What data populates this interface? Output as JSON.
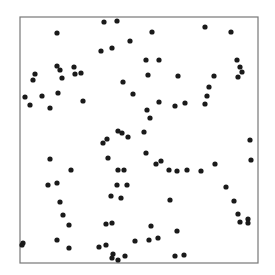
{
  "chart_data": {
    "type": "scatter",
    "title": "",
    "xlabel": "",
    "ylabel": "",
    "xlim": [
      0,
      1
    ],
    "ylim": [
      0,
      1
    ],
    "grid": false,
    "legend": null,
    "axes_ticks": false,
    "frame": {
      "left": 20,
      "top": 17,
      "right": 258,
      "bottom": 263,
      "color": "#777777"
    },
    "marker": {
      "color": "#1a1a1a",
      "radius": 2.6
    },
    "points_px": [
      [
        104,
        22
      ],
      [
        117,
        21
      ],
      [
        57,
        33
      ],
      [
        152,
        32
      ],
      [
        205,
        27
      ],
      [
        231,
        32
      ],
      [
        130,
        41
      ],
      [
        112,
        48
      ],
      [
        101,
        51
      ],
      [
        237,
        60
      ],
      [
        240,
        67
      ],
      [
        242,
        72
      ],
      [
        238,
        77
      ],
      [
        146,
        60
      ],
      [
        159,
        60
      ],
      [
        214,
        76
      ],
      [
        178,
        76
      ],
      [
        74,
        67
      ],
      [
        57,
        66
      ],
      [
        60,
        70
      ],
      [
        62,
        78
      ],
      [
        35,
        74
      ],
      [
        33,
        80
      ],
      [
        75,
        74
      ],
      [
        81,
        73
      ],
      [
        58,
        93
      ],
      [
        25,
        97
      ],
      [
        42,
        96
      ],
      [
        83,
        101
      ],
      [
        30,
        105
      ],
      [
        50,
        108
      ],
      [
        133,
        94
      ],
      [
        123,
        82
      ],
      [
        148,
        75
      ],
      [
        147,
        110
      ],
      [
        150,
        118
      ],
      [
        144,
        132
      ],
      [
        118,
        131
      ],
      [
        128,
        137
      ],
      [
        122,
        133
      ],
      [
        107,
        139
      ],
      [
        103,
        143
      ],
      [
        209,
        87
      ],
      [
        207,
        96
      ],
      [
        185,
        103
      ],
      [
        205,
        104
      ],
      [
        175,
        106
      ],
      [
        159,
        102
      ],
      [
        146,
        153
      ],
      [
        161,
        161
      ],
      [
        169,
        170
      ],
      [
        156,
        164
      ],
      [
        187,
        170
      ],
      [
        177,
        171
      ],
      [
        201,
        171
      ],
      [
        215,
        164
      ],
      [
        250,
        140
      ],
      [
        251,
        160
      ],
      [
        226,
        187
      ],
      [
        234,
        201
      ],
      [
        238,
        214
      ],
      [
        248,
        219
      ],
      [
        240,
        222
      ],
      [
        248,
        223
      ],
      [
        50,
        159
      ],
      [
        71,
        170
      ],
      [
        48,
        185
      ],
      [
        57,
        183
      ],
      [
        60,
        202
      ],
      [
        63,
        215
      ],
      [
        69,
        225
      ],
      [
        57,
        240
      ],
      [
        69,
        248
      ],
      [
        23,
        243
      ],
      [
        22,
        245
      ],
      [
        108,
        158
      ],
      [
        118,
        170
      ],
      [
        124,
        170
      ],
      [
        117,
        185
      ],
      [
        127,
        185
      ],
      [
        111,
        196
      ],
      [
        121,
        198
      ],
      [
        106,
        224
      ],
      [
        112,
        223
      ],
      [
        106,
        245
      ],
      [
        99,
        247
      ],
      [
        113,
        254
      ],
      [
        112,
        258
      ],
      [
        118,
        260
      ],
      [
        125,
        256
      ],
      [
        177,
        231
      ],
      [
        175,
        256
      ],
      [
        184,
        255
      ],
      [
        149,
        240
      ],
      [
        158,
        238
      ],
      [
        135,
        241
      ],
      [
        151,
        226
      ],
      [
        170,
        200
      ]
    ]
  }
}
